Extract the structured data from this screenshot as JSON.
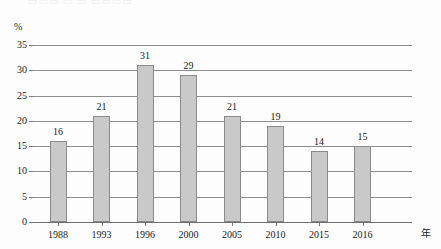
{
  "artifact": {
    "top_cropped_text": "▭▭▭  ▭ ▭ ▭▭▭▭"
  },
  "chart_data": {
    "type": "bar",
    "title": "",
    "subtitle": "",
    "xlabel": "年",
    "ylabel": "%",
    "categories": [
      "1988",
      "1993",
      "1996",
      "2000",
      "2005",
      "2010",
      "2015",
      "2016"
    ],
    "values": [
      16,
      21,
      31,
      29,
      21,
      19,
      14,
      15
    ],
    "data_labels": [
      "16",
      "21",
      "31",
      "29",
      "21",
      "19",
      "14",
      "15"
    ],
    "ylim": [
      0,
      35
    ],
    "ytick_labels": [
      "0",
      "5",
      "10",
      "15",
      "20",
      "25",
      "30",
      "35"
    ],
    "ytick_values": [
      0,
      5,
      10,
      15,
      20,
      25,
      30,
      35
    ],
    "grid": true,
    "grid_orientation": "horizontal",
    "legend": false,
    "legend_position": "none",
    "series": [
      {
        "name": "",
        "values": [
          16,
          21,
          31,
          29,
          21,
          19,
          14,
          15
        ]
      }
    ],
    "colors": {
      "bar_fill": "#c9c9c9",
      "bar_border": "#8a8a8a",
      "gridline": "#8d8d8d",
      "axis": "#6f6f6f",
      "text": "#1a1a1a",
      "background": "#fdfdfd"
    }
  }
}
